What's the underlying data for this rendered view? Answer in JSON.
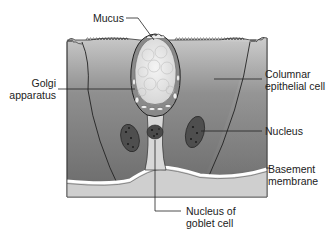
{
  "diagram": {
    "labels": {
      "mucus": "Mucus",
      "golgi_line1": "Golgi",
      "golgi_line2": "apparatus",
      "columnar_line1": "Columnar",
      "columnar_line2": "epithelial cell",
      "nucleus": "Nucleus",
      "basement_line1": "Basement",
      "basement_line2": "membrane",
      "goblet_nucleus_line1": "Nucleus of",
      "goblet_nucleus_line2": "goblet cell"
    },
    "colors": {
      "cell_dark": "#6e6e6e",
      "cell_light": "#b8b8b8",
      "connective": "#cfcfcf",
      "membrane": "#ffffff",
      "mucus": "#e6e6e6",
      "nucleus": "#4a4a4a",
      "line": "#222222"
    }
  }
}
